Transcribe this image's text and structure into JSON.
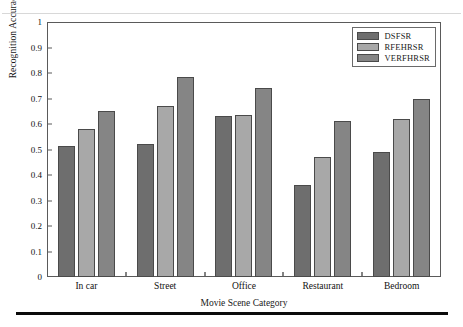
{
  "chart_data": {
    "type": "bar",
    "title": "",
    "xlabel": "Movie Scene Category",
    "ylabel": "Recognition Accuracy",
    "categories": [
      "In car",
      "Street",
      "Office",
      "Restaurant",
      "Bedroom"
    ],
    "series": [
      {
        "name": "DSFSR",
        "color": "#6e6e6e",
        "values": [
          0.515,
          0.52,
          0.63,
          0.36,
          0.49
        ]
      },
      {
        "name": "RFEHRSR",
        "color": "#a8a8a8",
        "values": [
          0.58,
          0.67,
          0.635,
          0.47,
          0.62
        ]
      },
      {
        "name": "VERFHRSR",
        "color": "#858585",
        "values": [
          0.65,
          0.785,
          0.74,
          0.61,
          0.7
        ]
      }
    ],
    "ylim": [
      0,
      1
    ],
    "yticks": [
      "0",
      "0.1",
      "0.2",
      "0.3",
      "0.4",
      "0.5",
      "0.6",
      "0.7",
      "0.8",
      "0.9",
      "1"
    ],
    "ytick_values": [
      0,
      0.1,
      0.2,
      0.3,
      0.4,
      0.5,
      0.6,
      0.7,
      0.8,
      0.9,
      1
    ],
    "grid": false,
    "legend_position": "top-right"
  }
}
